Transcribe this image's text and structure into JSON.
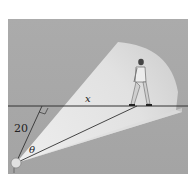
{
  "figure": {
    "labels": {
      "distance_to_path": "20",
      "distance_along_path": "x",
      "angle": "θ"
    },
    "colors": {
      "background": "#a9a9a9",
      "beam": "#e6e6e6",
      "line": "#333333",
      "page": "#ffffff"
    }
  }
}
